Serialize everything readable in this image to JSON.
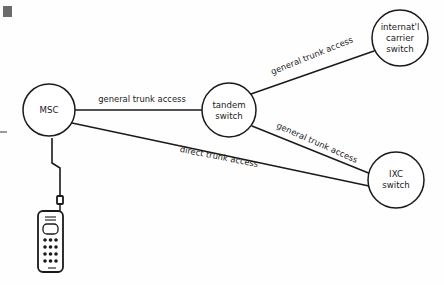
{
  "diagram": {
    "background_color": "#fefefe",
    "line_color": "#1a1a1a",
    "nodes": [
      {
        "id": "msc",
        "label_lines": [
          "MSC"
        ],
        "cx": 49,
        "cy": 110,
        "r": 26
      },
      {
        "id": "tandem",
        "label_lines": [
          "tandem",
          "switch"
        ],
        "cx": 229,
        "cy": 110,
        "r": 27
      },
      {
        "id": "international",
        "label_lines": [
          "internat'l",
          "carrier",
          "switch"
        ],
        "cx": 400,
        "cy": 38,
        "r": 28
      },
      {
        "id": "ixc",
        "label_lines": [
          "IXC",
          "switch"
        ],
        "cx": 396,
        "cy": 180,
        "r": 28
      }
    ],
    "links": [
      {
        "id": "msc-tandem",
        "from": "msc",
        "to": "tandem",
        "label": "general trunk access",
        "label_x": 142,
        "label_y": 99,
        "label_rotation": 0
      },
      {
        "id": "tandem-international",
        "from": "tandem",
        "to": "international",
        "label": "general trunk access",
        "label_x": 312,
        "label_y": 56,
        "label_rotation": -22
      },
      {
        "id": "tandem-ixc",
        "from": "tandem",
        "to": "ixc",
        "label": "general trunk access",
        "label_x": 317,
        "label_y": 143,
        "label_rotation": 24
      },
      {
        "id": "msc-ixc",
        "from": "msc",
        "to": "ixc",
        "label": "direct trunk access",
        "label_x": 219,
        "label_y": 157,
        "label_rotation": 11
      }
    ],
    "mobile": {
      "id": "mobile-handset",
      "rf_link_label": "",
      "keypad_rows": 4,
      "keypad_columns": 3
    },
    "artifacts": {
      "top_left_mark": true,
      "left_edge_dash": true
    }
  }
}
